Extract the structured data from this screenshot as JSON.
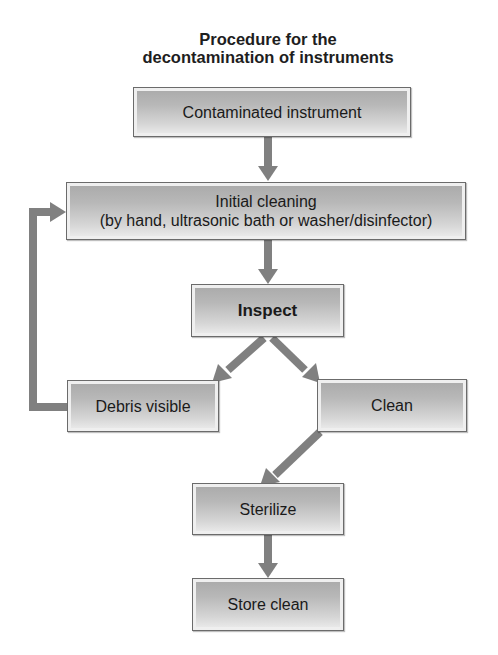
{
  "title": {
    "line1": "Procedure for the",
    "line2": "decontamination of instruments"
  },
  "nodes": {
    "contaminated": {
      "label": "Contaminated instrument"
    },
    "initial_cleaning": {
      "line1": "Initial cleaning",
      "line2": "(by hand, ultrasonic bath or washer/disinfector)"
    },
    "inspect": {
      "label": "Inspect"
    },
    "debris": {
      "label": "Debris visible"
    },
    "clean": {
      "label": "Clean"
    },
    "sterilize": {
      "label": "Sterilize"
    },
    "store": {
      "label": "Store clean"
    }
  },
  "edges": [
    {
      "from": "contaminated",
      "to": "initial_cleaning"
    },
    {
      "from": "initial_cleaning",
      "to": "inspect"
    },
    {
      "from": "inspect",
      "to": "debris"
    },
    {
      "from": "inspect",
      "to": "clean"
    },
    {
      "from": "debris",
      "to": "initial_cleaning"
    },
    {
      "from": "clean",
      "to": "sterilize"
    },
    {
      "from": "sterilize",
      "to": "store"
    }
  ],
  "colors": {
    "arrow": "#808080",
    "box_border": "#6b6b6b",
    "box_fill_top": "#a9a9a9",
    "box_fill_bottom": "#eeeeee",
    "text": "#1a1a1a"
  }
}
